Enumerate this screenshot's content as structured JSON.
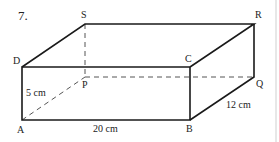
{
  "problem": {
    "number": "7."
  },
  "vertices": {
    "A": {
      "label": "A",
      "x": 22,
      "y": 120
    },
    "B": {
      "label": "B",
      "x": 190,
      "y": 120
    },
    "C": {
      "label": "C",
      "x": 190,
      "y": 67
    },
    "D": {
      "label": "D",
      "x": 22,
      "y": 67
    },
    "P": {
      "label": "P",
      "x": 85,
      "y": 77
    },
    "Q": {
      "label": "Q",
      "x": 254,
      "y": 77
    },
    "R": {
      "label": "R",
      "x": 254,
      "y": 24
    },
    "S": {
      "label": "S",
      "x": 85,
      "y": 24
    }
  },
  "dimensions": {
    "height": "5 cm",
    "length": "20 cm",
    "width": "12 cm"
  },
  "colors": {
    "line": "#1a1a1a",
    "hidden": "#555555",
    "divider": "#cfcfcf"
  }
}
